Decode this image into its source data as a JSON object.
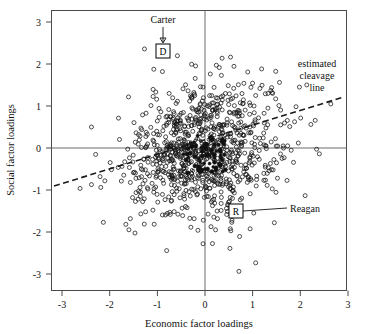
{
  "figure": {
    "name": "scatter-plot-figure",
    "background_color": "#ffffff"
  },
  "chart_data": {
    "type": "scatter",
    "title": "",
    "subtitle": "",
    "xlabel": "Economic factor loadings",
    "ylabel": "Social factor loadings",
    "xlim": [
      -3.4,
      3.4
    ],
    "ylim": [
      -3.4,
      3.4
    ],
    "xticks": [
      -3,
      -2,
      -1,
      0,
      1,
      2,
      3
    ],
    "yticks": [
      -3,
      -2,
      -1,
      0,
      1,
      2,
      3
    ],
    "xtick_labels": [
      "-3",
      "-2",
      "-1",
      "0",
      "1",
      "2",
      "3"
    ],
    "ytick_labels": [
      "-3",
      "-2",
      "-1",
      "0",
      "1",
      "2",
      "3"
    ],
    "grid": false,
    "legend": "none",
    "zero_axes": {
      "x": 0,
      "y": 0,
      "color": "#6a6a6a"
    },
    "marker": {
      "shape": "open-circle",
      "size": 3.1,
      "color": "#151515"
    },
    "point_count": 1000,
    "series": [
      {
        "name": "respondents",
        "description": "open circles, dense bivariate cloud centred near (0,0)",
        "n": 1000,
        "x_mean": -0.02,
        "y_mean": -0.05,
        "x_sd": 0.78,
        "y_sd": 0.85,
        "correlation": 0.18
      }
    ],
    "reference_lines": [
      {
        "name": "estimated cleavage line",
        "style": "dashed",
        "x1": -3.25,
        "y1": -0.82,
        "x2": 3.0,
        "y2": 1.22,
        "color": "#1a1a1a"
      }
    ],
    "annotations": [
      {
        "name": "carter",
        "label": "Carter",
        "marker_letter": "D",
        "marker_x": -1.0,
        "marker_y": 2.35,
        "label_x": -1.0,
        "label_y": 3.02,
        "leader": "arrow-down"
      },
      {
        "name": "reagan",
        "label": "Reagan",
        "marker_letter": "R",
        "marker_x": 0.55,
        "marker_y": -1.45,
        "label_x": 2.15,
        "label_y": -1.45,
        "leader": "line-left"
      },
      {
        "name": "cleavage-line-label",
        "label_lines": [
          "estimated",
          "cleavage",
          "line"
        ],
        "label_x": 2.35,
        "label_y": 1.95
      }
    ]
  },
  "labels": {
    "x_axis_title": "Economic factor loadings",
    "y_axis_title": "Social factor loadings",
    "carter": "Carter",
    "carter_marker": "D",
    "reagan": "Reagan",
    "reagan_marker": "R",
    "cleavage_line_1": "estimated",
    "cleavage_line_2": "cleavage",
    "cleavage_line_3": "line"
  }
}
